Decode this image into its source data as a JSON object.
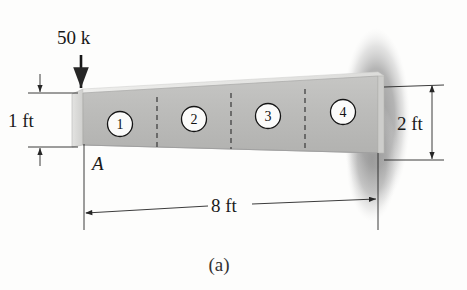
{
  "figure": {
    "caption": "(a)",
    "type": "engineering-diagram"
  },
  "load": {
    "label": "50 k",
    "direction": "down",
    "applied_at": "A"
  },
  "dimensions": {
    "left_depth": "1 ft",
    "right_depth": "2 ft",
    "length": "8 ft"
  },
  "node_labels": {
    "free_end": "A"
  },
  "elements": [
    {
      "number": "1"
    },
    {
      "number": "2"
    },
    {
      "number": "3"
    },
    {
      "number": "4"
    }
  ],
  "colors": {
    "beam_front": "#b9b9b9",
    "beam_top": "#e4e4e2",
    "beam_end": "#d8d8d6",
    "support_blob": "#9b9b9b",
    "line": "#262626",
    "background": "#fdfdfc"
  }
}
